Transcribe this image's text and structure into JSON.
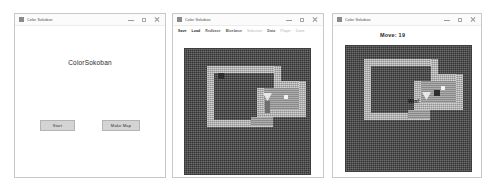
{
  "windows": [
    {
      "title": "Color Sokoban",
      "heading": "ColorSokoban",
      "buttons": {
        "start": "Start",
        "make_map": "Make Map"
      },
      "controls": {
        "minimize": "minimize-icon",
        "maximize": "maximize-icon",
        "close": "close-icon"
      }
    },
    {
      "title": "Color Sokoban",
      "menu": [
        {
          "label": "Save",
          "state": "active"
        },
        {
          "label": "Load",
          "state": "active"
        },
        {
          "label": "Redbase",
          "state": "mid"
        },
        {
          "label": "Bluebase",
          "state": "mid"
        },
        {
          "label": "Selection",
          "state": "disabled"
        },
        {
          "label": "Data",
          "state": "mid"
        },
        {
          "label": "Player",
          "state": "disabled"
        },
        {
          "label": "Done",
          "state": "disabled"
        }
      ],
      "controls": {
        "minimize": "minimize-icon",
        "maximize": "maximize-icon",
        "close": "close-icon"
      }
    },
    {
      "title": "Color Sokoban",
      "move_label": "Move: 19",
      "win_label": "Win!",
      "controls": {
        "minimize": "minimize-icon",
        "maximize": "maximize-icon",
        "close": "close-icon"
      }
    }
  ],
  "colors": {
    "window_bg": "#ffffff",
    "board_bg": "#4a4a4a",
    "wall": "#b9b9b9",
    "floor": "#9d9d9d",
    "button_face": "#d4d4d4",
    "text": "#2b2b2b"
  }
}
